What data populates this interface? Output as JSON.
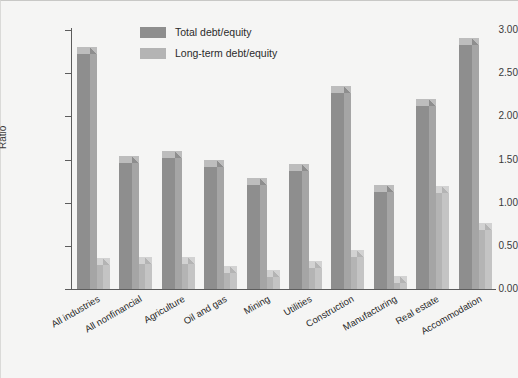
{
  "chart_data": {
    "type": "bar",
    "title": "",
    "xlabel": "",
    "ylabel": "Ratio",
    "ylim": [
      0.0,
      3.0
    ],
    "ytick_labels": [
      "0.00",
      "0.50",
      "1.00",
      "1.50",
      "2.00",
      "2.50",
      "3.00"
    ],
    "ytick_values": [
      0.0,
      0.5,
      1.0,
      1.5,
      2.0,
      2.5,
      3.0
    ],
    "grid": false,
    "legend_position": "top-center",
    "style": "3d-bar",
    "categories": [
      "All industries",
      "All nonfinancial",
      "Agriculture",
      "Oil and gas",
      "Mining",
      "Utilities",
      "Construction",
      "Manufacturing",
      "Real estate",
      "Accommodation"
    ],
    "series": [
      {
        "name": "Total debt/equity",
        "color": "#8e8e8e",
        "values": [
          2.72,
          1.46,
          1.52,
          1.41,
          1.21,
          1.37,
          2.27,
          1.12,
          2.12,
          2.83
        ]
      },
      {
        "name": "Long-term debt/equity",
        "color": "#b4b4b4",
        "values": [
          0.28,
          0.29,
          0.29,
          0.19,
          0.14,
          0.24,
          0.37,
          0.07,
          1.11,
          0.68
        ]
      }
    ]
  },
  "legend": {
    "items": [
      {
        "label": "Total debt/equity"
      },
      {
        "label": "Long-term debt/equity"
      }
    ]
  },
  "axes": {
    "y_axis_label": "Ratio"
  }
}
